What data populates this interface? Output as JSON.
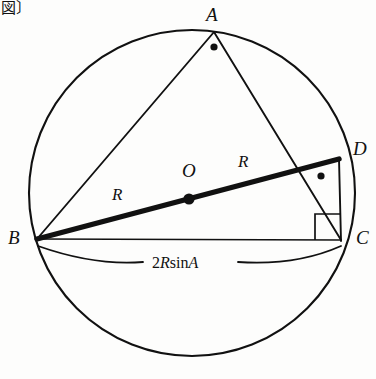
{
  "figure": {
    "caption": "図〕",
    "title_note": "Circumscribed circle of triangle ABC with diameter BD",
    "background_color": "#fdfdfc",
    "stroke_color": "#111111"
  },
  "labels": {
    "vertex_a": "A",
    "vertex_b": "B",
    "vertex_c": "C",
    "vertex_d": "D",
    "center_o": "O",
    "radius_left": "R",
    "radius_right": "R"
  },
  "measure": {
    "prefix": "2",
    "radius_symbol": "R",
    "function": "sin",
    "angle_symbol": "A",
    "full_text": "2RsinA"
  },
  "geometry": {
    "circle": {
      "cx": 192,
      "cy": 193,
      "r": 163
    },
    "points": {
      "A": {
        "x": 214,
        "y": 32
      },
      "B": {
        "x": 37,
        "y": 239
      },
      "C": {
        "x": 341,
        "y": 240
      },
      "D": {
        "x": 339,
        "y": 159
      },
      "O": {
        "x": 189,
        "y": 199
      }
    },
    "segments": [
      {
        "name": "BA",
        "from": "B",
        "to": "A",
        "weight": "thin"
      },
      {
        "name": "AC",
        "from": "A",
        "to": "C",
        "weight": "thin"
      },
      {
        "name": "BC",
        "from": "B",
        "to": "C",
        "weight": "thin"
      },
      {
        "name": "BD",
        "from": "B",
        "to": "D",
        "weight": "thick"
      }
    ],
    "angle_markers": [
      {
        "name": "angle-a-dot",
        "x": 214,
        "y": 47
      },
      {
        "name": "angle-d-dot",
        "x": 321,
        "y": 176
      }
    ],
    "right_angle": {
      "vertex": "C",
      "size": 26
    },
    "center_dot": {
      "x": 189,
      "y": 199,
      "r": 5.5
    }
  },
  "colors": {
    "stroke": "#111111",
    "background": "#fdfdfc",
    "text": "#111111"
  }
}
